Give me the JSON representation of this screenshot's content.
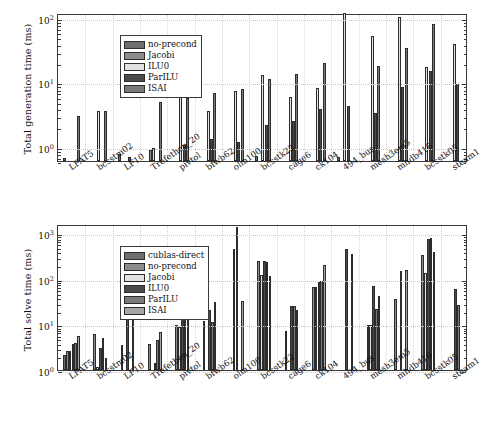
{
  "figure": {
    "background": "#ffffff",
    "panels": [
      "generation",
      "solve"
    ]
  },
  "colors": {
    "cublas-direct": "#6e6e6e",
    "no-precond": "#8c8c8c",
    "Jacobi": "#d9d9d9",
    "ILU0": "#4a4a4a",
    "ParILU": "#7a7a7a",
    "ISAI": "#a6a6a6",
    "axis": "#3a3a3a",
    "grid": "#c9c9c9",
    "text": "#111111"
  },
  "top_panel": {
    "ylabel": "Total generation time (ms)",
    "yticks": [
      "10",
      "10",
      "10"
    ],
    "ytick_exponents": [
      "0",
      "1",
      "2"
    ]
  },
  "bottom_panel": {
    "ylabel": "Total solve time (ms)",
    "yticks": [
      "10",
      "10",
      "10",
      "10"
    ],
    "ytick_exponents": [
      "0",
      "1",
      "2",
      "3"
    ]
  },
  "legend_top": {
    "items": [
      {
        "label": "no-precond",
        "color": "#6e6e6e"
      },
      {
        "label": "Jacobi",
        "color": "#8c8c8c"
      },
      {
        "label": "ILU0",
        "color": "#e2e2e2"
      },
      {
        "label": "ParILU",
        "color": "#4a4a4a"
      },
      {
        "label": "ISAI",
        "color": "#7a7a7a"
      }
    ]
  },
  "legend_bottom": {
    "items": [
      {
        "label": "cublas-direct",
        "color": "#6e6e6e"
      },
      {
        "label": "no-precond",
        "color": "#8c8c8c"
      },
      {
        "label": "Jacobi",
        "color": "#e2e2e2"
      },
      {
        "label": "ILU0",
        "color": "#4a4a4a"
      },
      {
        "label": "ParILU",
        "color": "#7a7a7a"
      },
      {
        "label": "ISAI",
        "color": "#a6a6a6"
      }
    ]
  },
  "chart_data": [
    {
      "type": "bar",
      "id": "total-generation-time",
      "title": "",
      "xlabel": "",
      "ylabel": "Total generation time (ms)",
      "yscale": "log",
      "ylim": [
        0.6,
        120
      ],
      "ytick_values": [
        1,
        10,
        100
      ],
      "ytick_labels": [
        "10^0",
        "10^1",
        "10^2"
      ],
      "grid": true,
      "legend_position": "upper-left",
      "categories": [
        "LFAT5",
        "bcsstm02",
        "LF10",
        "Trefethen_20",
        "pivtol",
        "bfwb62",
        "olm100",
        "bcsstk22",
        "cage6",
        "ck104",
        "494_bus",
        "mesh3em5",
        "mhdb416",
        "bcsstk05",
        "steam1"
      ],
      "series": [
        {
          "name": "no-precond",
          "color": "#6e6e6e",
          "values": [
            0.68,
            null,
            0.78,
            null,
            null,
            null,
            null,
            0.72,
            null,
            null,
            0.7,
            null,
            null,
            null,
            null
          ]
        },
        {
          "name": "Jacobi",
          "color": "#8c8c8c",
          "values": [
            null,
            null,
            null,
            0.88,
            null,
            null,
            null,
            null,
            null,
            null,
            null,
            null,
            null,
            null,
            null
          ]
        },
        {
          "name": "ILU0",
          "color": "#e2e2e2",
          "values": [
            null,
            3.6,
            null,
            0.97,
            7.3,
            3.6,
            7.3,
            13.0,
            5.9,
            8.3,
            130,
            53,
            105,
            17.5,
            40
          ]
        },
        {
          "name": "ParILU",
          "color": "#4a4a4a",
          "values": [
            null,
            null,
            0.7,
            null,
            1.08,
            1.3,
            1.18,
            2.15,
            2.55,
            3.85,
            4.25,
            3.35,
            8.4,
            14.8,
            9.3
          ]
        },
        {
          "name": "ISAI",
          "color": "#7a7a7a",
          "values": [
            3.0,
            3.6,
            null,
            4.9,
            5.7,
            6.9,
            7.8,
            11.5,
            13.3,
            20.0,
            null,
            17.8,
            34,
            80,
            null
          ]
        }
      ]
    },
    {
      "type": "bar",
      "id": "total-solve-time",
      "title": "",
      "xlabel": "",
      "ylabel": "Total solve time (ms)",
      "yscale": "log",
      "ylim": [
        1,
        1600
      ],
      "ytick_values": [
        1,
        10,
        100,
        1000
      ],
      "ytick_labels": [
        "10^0",
        "10^1",
        "10^2",
        "10^3"
      ],
      "grid": true,
      "legend_position": "upper-left",
      "categories": [
        "LFAT5",
        "bcsstm02",
        "LF10",
        "Trefethen_20",
        "pivtol",
        "bfwb62",
        "olm100",
        "bcsstk22",
        "cage6",
        "ck104",
        "494_bus",
        "mesh3em5",
        "mhdb416",
        "bcsstk05",
        "steam1"
      ],
      "series": [
        {
          "name": "cublas-direct",
          "color": "#6e6e6e",
          "values": [
            2.1,
            null,
            null,
            null,
            null,
            null,
            null,
            null,
            null,
            null,
            null,
            null,
            null,
            null,
            null
          ]
        },
        {
          "name": "no-precond",
          "color": "#8c8c8c",
          "values": [
            2.6,
            6.2,
            3.6,
            3.8,
            9.9,
            11.7,
            null,
            250,
            7.3,
            67,
            null,
            9.9,
            37,
            330,
            null
          ]
        },
        {
          "name": "Jacobi",
          "color": "#e2e2e2",
          "values": [
            2.6,
            1.15,
            null,
            null,
            8.6,
            null,
            450,
            120,
            null,
            67,
            null,
            9.9,
            null,
            135,
            null
          ]
        },
        {
          "name": "ILU0",
          "color": "#4a4a4a",
          "values": [
            3.7,
            3.0,
            31,
            1.45,
            49,
            20.5,
            1400,
            250,
            25.5,
            85,
            450,
            70,
            150,
            760,
            60
          ]
        },
        {
          "name": "ParILU",
          "color": "#7a7a7a",
          "values": [
            3.9,
            5.0,
            null,
            4.6,
            45,
            11.4,
            null,
            230,
            25.5,
            90,
            null,
            22,
            null,
            770,
            27
          ]
        },
        {
          "name": "ISAI",
          "color": "#a6a6a6",
          "values": [
            5.5,
            1.85,
            26,
            6.9,
            13.5,
            31.5,
            33,
            115,
            21,
            200,
            350,
            43,
            160,
            385,
            null
          ]
        }
      ]
    }
  ]
}
